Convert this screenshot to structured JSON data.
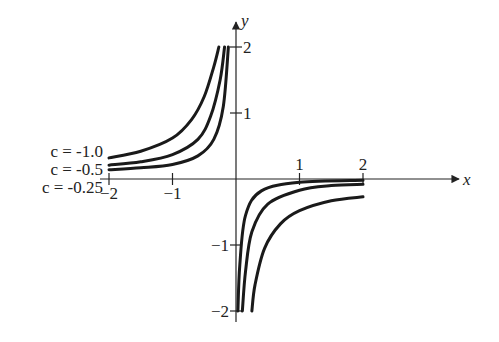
{
  "chart_data": {
    "type": "line",
    "title": "",
    "xlabel": "x",
    "ylabel": "y",
    "xlim": [
      -2,
      2
    ],
    "ylim": [
      -2,
      2
    ],
    "x_ticks": [
      "-2",
      "-1",
      "1",
      "2"
    ],
    "y_ticks": [
      "2",
      "1",
      "-1",
      "-2"
    ],
    "grid": false,
    "legend_position": "left, beside curves",
    "series": [
      {
        "name": "c = -1.0",
        "left": [
          [
            -2,
            0.32
          ],
          [
            -1.5,
            0.42
          ],
          [
            -1,
            0.62
          ],
          [
            -0.7,
            0.9
          ],
          [
            -0.5,
            1.25
          ],
          [
            -0.35,
            1.7
          ],
          [
            -0.27,
            2.0
          ]
        ],
        "right": [
          [
            0.25,
            -2.0
          ],
          [
            0.3,
            -1.6
          ],
          [
            0.45,
            -1.05
          ],
          [
            0.7,
            -0.68
          ],
          [
            1,
            -0.48
          ],
          [
            1.5,
            -0.33
          ],
          [
            2,
            -0.27
          ]
        ]
      },
      {
        "name": "c = -0.5",
        "left": [
          [
            -2,
            0.21
          ],
          [
            -1.5,
            0.26
          ],
          [
            -1,
            0.37
          ],
          [
            -0.6,
            0.6
          ],
          [
            -0.4,
            0.95
          ],
          [
            -0.25,
            1.5
          ],
          [
            -0.18,
            2.0
          ]
        ],
        "right": [
          [
            0.1,
            -2.0
          ],
          [
            0.15,
            -1.4
          ],
          [
            0.25,
            -0.8
          ],
          [
            0.5,
            -0.38
          ],
          [
            1,
            -0.17
          ],
          [
            1.5,
            -0.1
          ],
          [
            2,
            -0.08
          ]
        ]
      },
      {
        "name": "c = -0.25",
        "left": [
          [
            -2,
            0.14
          ],
          [
            -1.5,
            0.17
          ],
          [
            -1,
            0.22
          ],
          [
            -0.6,
            0.35
          ],
          [
            -0.35,
            0.6
          ],
          [
            -0.2,
            1.1
          ],
          [
            -0.12,
            2.0
          ]
        ],
        "right": [
          [
            0.03,
            -2.0
          ],
          [
            0.06,
            -1.3
          ],
          [
            0.15,
            -0.55
          ],
          [
            0.4,
            -0.18
          ],
          [
            1,
            -0.05
          ],
          [
            2,
            -0.02
          ]
        ]
      }
    ],
    "annotations": [
      "c = -1.0",
      "c = -0.5",
      "c = -0.25"
    ]
  }
}
